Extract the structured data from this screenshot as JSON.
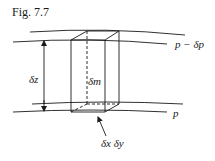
{
  "figure": {
    "caption": "Fig. 7.7"
  },
  "labels": {
    "upper_surface": "p − δp",
    "lower_surface": "p",
    "height": "δz",
    "mass": "δm",
    "base_area": "δx δy"
  },
  "colors": {
    "ink": "#1a1a1a",
    "background": "#ffffff"
  }
}
